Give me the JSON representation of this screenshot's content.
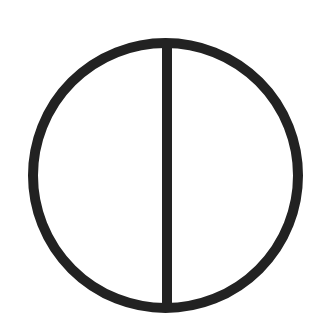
{
  "diagram": {
    "background": "#ffffff",
    "stroke_color": "#222222",
    "circle": {
      "cx": 165.5,
      "cy": 175.5,
      "r": 132.5,
      "stroke_width": 10
    },
    "line": {
      "x1": 167,
      "y1": 43,
      "x2": 167,
      "y2": 308,
      "stroke_width": 10
    }
  }
}
